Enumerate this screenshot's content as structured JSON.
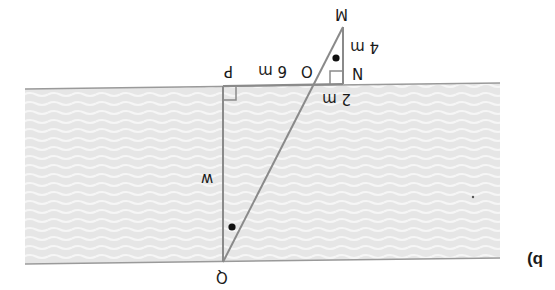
{
  "figure": {
    "part_label": "b)",
    "orientation": "rotated 180°",
    "colors": {
      "river_fill": "#e6e6e6",
      "river_waves": "#f6f6f6",
      "lines": "#8a8a8a",
      "text": "#1a1a1a"
    },
    "points": {
      "M": "M",
      "N": "N",
      "O": "O",
      "P": "P",
      "Q": "Q"
    },
    "lengths": {
      "MN": "4 m",
      "NO": "2 m",
      "OP": "6 m",
      "PQ": "w"
    }
  }
}
